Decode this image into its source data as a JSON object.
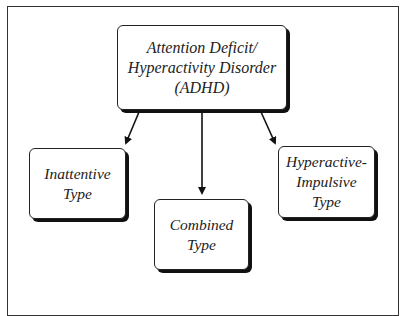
{
  "diagram": {
    "root": {
      "lines": [
        "Attention Deficit/",
        "Hyperactivity Disorder",
        "(ADHD)"
      ]
    },
    "children": [
      {
        "id": "inattentive",
        "lines": [
          "Inattentive",
          "Type"
        ]
      },
      {
        "id": "combined",
        "lines": [
          "Combined",
          "Type"
        ]
      },
      {
        "id": "hyperactive-impulsive",
        "lines": [
          "Hyperactive-",
          "Impulsive",
          "Type"
        ]
      }
    ],
    "edges": [
      {
        "from": "root",
        "to": "inattentive"
      },
      {
        "from": "root",
        "to": "combined"
      },
      {
        "from": "root",
        "to": "hyperactive-impulsive"
      }
    ],
    "colors": {
      "stroke": "#222222",
      "background": "#ffffff",
      "shadow": "#111111"
    }
  }
}
